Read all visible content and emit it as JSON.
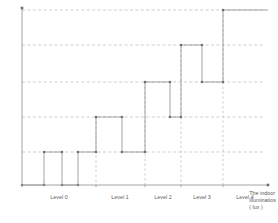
{
  "chart_data": {
    "type": "line",
    "subtype": "step",
    "title": "",
    "xlabel_lines": [
      "The indoor",
      "illuminatios",
      "( lux )"
    ],
    "ylabel": "",
    "xlim": [
      0,
      250
    ],
    "ylim": [
      0,
      190
    ],
    "grid": true,
    "grid_style": "dashed",
    "legend": "none",
    "categories": [
      "Level 0",
      "Level 1",
      "Level 2",
      "Level 3",
      "Level 4"
    ],
    "x_band_edges": [
      22,
      96,
      145,
      181,
      223,
      268
    ],
    "y_gridlines": [
      10,
      45,
      82,
      117,
      152
    ],
    "step_points": [
      {
        "x": 22,
        "y": 185
      },
      {
        "x": 44,
        "y": 185
      },
      {
        "x": 44,
        "y": 152
      },
      {
        "x": 62,
        "y": 152
      },
      {
        "x": 62,
        "y": 185
      },
      {
        "x": 78,
        "y": 185
      },
      {
        "x": 78,
        "y": 152
      },
      {
        "x": 96,
        "y": 152
      },
      {
        "x": 96,
        "y": 117
      },
      {
        "x": 122,
        "y": 117
      },
      {
        "x": 122,
        "y": 152
      },
      {
        "x": 145,
        "y": 152
      },
      {
        "x": 145,
        "y": 82
      },
      {
        "x": 170,
        "y": 82
      },
      {
        "x": 170,
        "y": 117
      },
      {
        "x": 181,
        "y": 117
      },
      {
        "x": 181,
        "y": 45
      },
      {
        "x": 202,
        "y": 45
      },
      {
        "x": 202,
        "y": 82
      },
      {
        "x": 223,
        "y": 82
      },
      {
        "x": 223,
        "y": 10
      },
      {
        "x": 268,
        "y": 10
      }
    ],
    "series": [
      {
        "name": "Lighting step response",
        "x": [
          22,
          44,
          62,
          78,
          96,
          122,
          145,
          170,
          181,
          202,
          223,
          268
        ],
        "values": [
          185,
          152,
          185,
          152,
          117,
          152,
          82,
          117,
          45,
          82,
          10,
          10
        ]
      }
    ],
    "markers": [
      {
        "x": 22,
        "y": 185
      },
      {
        "x": 44,
        "y": 185
      },
      {
        "x": 44,
        "y": 152
      },
      {
        "x": 62,
        "y": 152
      },
      {
        "x": 62,
        "y": 185
      },
      {
        "x": 78,
        "y": 185
      },
      {
        "x": 78,
        "y": 152
      },
      {
        "x": 96,
        "y": 152
      },
      {
        "x": 96,
        "y": 117
      },
      {
        "x": 122,
        "y": 117
      },
      {
        "x": 122,
        "y": 152
      },
      {
        "x": 145,
        "y": 152
      },
      {
        "x": 145,
        "y": 82
      },
      {
        "x": 170,
        "y": 82
      },
      {
        "x": 170,
        "y": 117
      },
      {
        "x": 181,
        "y": 117
      },
      {
        "x": 181,
        "y": 45
      },
      {
        "x": 202,
        "y": 45
      },
      {
        "x": 202,
        "y": 82
      },
      {
        "x": 223,
        "y": 82
      },
      {
        "x": 223,
        "y": 10
      }
    ],
    "colors": {
      "axis": "#9a9a9a",
      "grid": "#b9b9b9",
      "step_line": "#8e8e8e",
      "marker": "#6e6e6e",
      "text": "#5a5a5a"
    }
  },
  "axes": {
    "x_axis_name": "indoor-illuminance-axis",
    "y_axis_name": "lighting-level-axis",
    "x_caption_line_1": "The indoor",
    "x_caption_line_2": "illuminatios",
    "x_caption_line_3": "( lux )"
  },
  "level_labels": [
    {
      "label": "Level 0",
      "center_x": 59
    },
    {
      "label": "Level 1",
      "center_x": 120
    },
    {
      "label": "Level 2",
      "center_x": 163
    },
    {
      "label": "Level 3",
      "center_x": 202
    },
    {
      "label": "Level 4",
      "center_x": 245
    }
  ]
}
